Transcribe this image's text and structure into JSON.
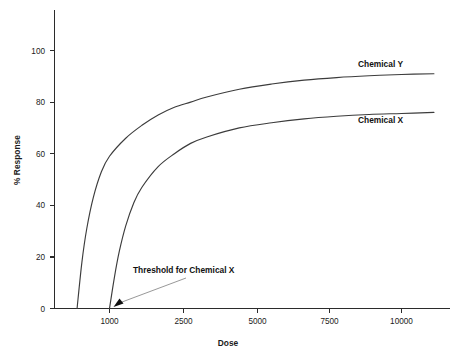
{
  "chart_data": {
    "type": "line",
    "title": "",
    "xlabel": "Dose",
    "ylabel": "% Response",
    "xlim": [
      0,
      11400
    ],
    "ylim": [
      0,
      115
    ],
    "grid": false,
    "legend_position": "inline-right-of-curve",
    "x_ticks": [
      1000,
      2500,
      5000,
      7500,
      10000
    ],
    "x_tick_labels": [
      "1000",
      "2500",
      "5000",
      "7500",
      "10000"
    ],
    "y_ticks": [
      0,
      20,
      40,
      60,
      80,
      100
    ],
    "y_tick_labels": [
      "0",
      "20",
      "40",
      "60",
      "80",
      "100"
    ],
    "series": [
      {
        "name": "Chemical Y",
        "label": "Chemical Y",
        "threshold": 0,
        "x": [
          0,
          150,
          300,
          500,
          750,
          1000,
          1500,
          2000,
          2500,
          3000,
          3500,
          4000,
          5000,
          6000,
          7000,
          8000,
          9000,
          10000,
          11000
        ],
        "values": [
          0,
          18,
          31,
          43,
          53,
          59,
          66,
          71,
          75,
          78,
          80,
          82,
          85,
          87,
          88.5,
          89.5,
          90.2,
          90.7,
          91
        ]
      },
      {
        "name": "Chemical X",
        "label": "Chemical X",
        "threshold": 1000,
        "x": [
          1000,
          1150,
          1300,
          1500,
          1750,
          2000,
          2500,
          3000,
          3500,
          4000,
          5000,
          6000,
          7000,
          8000,
          9000,
          10000,
          11000
        ],
        "values": [
          0,
          12,
          22,
          32,
          41,
          47,
          55,
          60,
          64,
          66.5,
          70,
          72,
          73.5,
          74.5,
          75.2,
          75.6,
          76
        ]
      }
    ],
    "annotations": [
      {
        "text": "Threshold for Chemical X",
        "points_to_x": 1000,
        "points_to_y": 0
      }
    ]
  },
  "colors": {
    "background": "#ffffff",
    "axis": "#2b2b2b",
    "curve": "#3c3c3c",
    "leader": "#8c8c8c",
    "text": "#1a1a1a"
  }
}
